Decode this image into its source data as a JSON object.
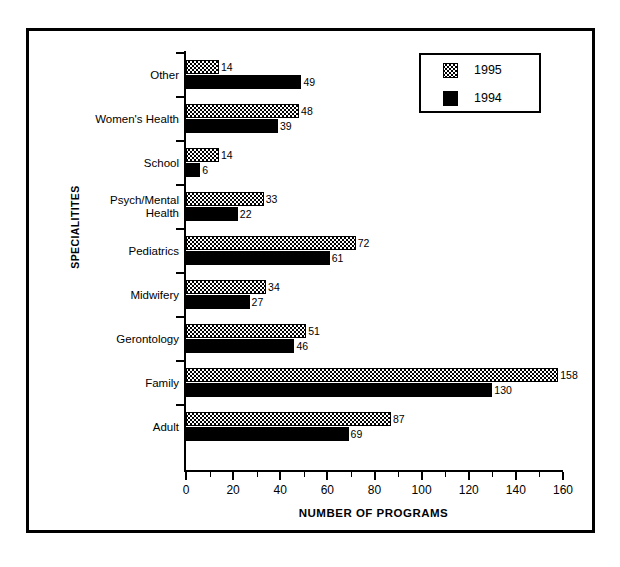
{
  "chart_data": {
    "type": "bar",
    "orientation": "horizontal",
    "title": "",
    "xlabel": "NUMBER OF PROGRAMS",
    "ylabel": "SPECIALITITES",
    "xlim": [
      0,
      160
    ],
    "xticks": [
      0,
      20,
      40,
      60,
      80,
      100,
      120,
      140,
      160
    ],
    "xtick_labels": [
      "0",
      "20",
      "40",
      "60",
      "80",
      "100",
      "120",
      "140",
      "160"
    ],
    "minor_tick_step": 10,
    "grid": false,
    "legend_position": "top-right",
    "legend": [
      "1995",
      "1994"
    ],
    "categories": [
      "Other",
      "Women's Health",
      "School",
      "Psych/Mental Health",
      "Pediatrics",
      "Midwifery",
      "Gerontology",
      "Family",
      "Adult"
    ],
    "series": [
      {
        "name": "1995",
        "color": "#ffffff",
        "pattern": "cross-hatch",
        "values": [
          14,
          48,
          14,
          33,
          72,
          34,
          51,
          158,
          87
        ]
      },
      {
        "name": "1994",
        "color": "#000000",
        "pattern": "solid",
        "values": [
          49,
          39,
          6,
          22,
          61,
          27,
          46,
          130,
          69
        ]
      }
    ],
    "bars": [
      {
        "category": "Other",
        "label_line1": "Other",
        "label_line2": "",
        "v1995": 14,
        "v1994": 49
      },
      {
        "category": "Women's Health",
        "label_line1": "Women's Health",
        "label_line2": "",
        "v1995": 48,
        "v1994": 39
      },
      {
        "category": "School",
        "label_line1": "School",
        "label_line2": "",
        "v1995": 14,
        "v1994": 6
      },
      {
        "category": "Psych/Mental Health",
        "label_line1": "Psych/Mental",
        "label_line2": "Health",
        "v1995": 33,
        "v1994": 22
      },
      {
        "category": "Pediatrics",
        "label_line1": "Pediatrics",
        "label_line2": "",
        "v1995": 72,
        "v1994": 61
      },
      {
        "category": "Midwifery",
        "label_line1": "Midwifery",
        "label_line2": "",
        "v1995": 34,
        "v1994": 27
      },
      {
        "category": "Gerontology",
        "label_line1": "Gerontology",
        "label_line2": "",
        "v1995": 51,
        "v1994": 46
      },
      {
        "category": "Family",
        "label_line1": "Family",
        "label_line2": "",
        "v1995": 158,
        "v1994": 130
      },
      {
        "category": "Adult",
        "label_line1": "Adult",
        "label_line2": "",
        "v1995": 87,
        "v1994": 69
      }
    ]
  },
  "colors": {
    "frame": "#000000",
    "axis": "#000000",
    "series_1995": "#ffffff",
    "series_1994": "#000000",
    "background": "#ffffff"
  }
}
